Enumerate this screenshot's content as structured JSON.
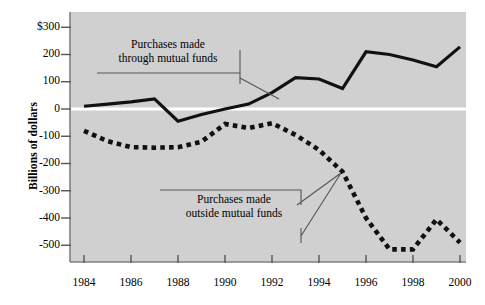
{
  "chart_data": {
    "type": "line",
    "title": "",
    "xlabel": "",
    "ylabel": "Billions of dollars",
    "xlim": [
      1984,
      2000
    ],
    "ylim": [
      -560,
      320
    ],
    "grid": false,
    "legend_position": "annotations-inline",
    "plot_background": "#d0d0d0",
    "x_ticks": [
      "1984",
      "1986",
      "1988",
      "1990",
      "1992",
      "1994",
      "1996",
      "1998",
      "2000"
    ],
    "y_ticks": [
      "$300",
      "200",
      "100",
      "0",
      "-100",
      "-200",
      "-300",
      "-400",
      "-500"
    ],
    "x": [
      1984,
      1985,
      1986,
      1987,
      1988,
      1989,
      1990,
      1991,
      1992,
      1993,
      1994,
      1995,
      1996,
      1997,
      1998,
      1999,
      2000
    ],
    "series": [
      {
        "name": "Purchases made through mutual funds",
        "style": "solid",
        "color": "#111111",
        "values": [
          10,
          18,
          26,
          37,
          -45,
          -20,
          0,
          18,
          60,
          115,
          110,
          75,
          210,
          200,
          180,
          155,
          228
        ]
      },
      {
        "name": "Purchases made outside mutual funds",
        "style": "dotted",
        "color": "#111111",
        "values": [
          -80,
          -118,
          -140,
          -142,
          -140,
          -120,
          -55,
          -70,
          -52,
          -95,
          -150,
          -230,
          -400,
          -515,
          -515,
          -405,
          -490
        ]
      }
    ],
    "annotations": [
      {
        "id": "annotation-mutual-funds",
        "line1": "Purchases made",
        "line2": "through mutual funds"
      },
      {
        "id": "annotation-outside-funds",
        "line1": "Purchases made",
        "line2": "outside mutual funds"
      }
    ]
  },
  "axis": {
    "y_title": "Billions of dollars"
  }
}
